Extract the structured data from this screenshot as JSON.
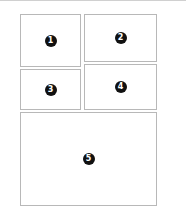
{
  "diagram": {
    "type": "panel-layout",
    "panels": [
      {
        "label": "1",
        "x": 20,
        "y": 14,
        "w": 61,
        "h": 53
      },
      {
        "label": "2",
        "x": 84,
        "y": 14,
        "w": 73,
        "h": 48
      },
      {
        "label": "3",
        "x": 20,
        "y": 69,
        "w": 61,
        "h": 41
      },
      {
        "label": "4",
        "x": 84,
        "y": 64,
        "w": 73,
        "h": 46
      },
      {
        "label": "5",
        "x": 20,
        "y": 112,
        "w": 137,
        "h": 94
      }
    ]
  }
}
